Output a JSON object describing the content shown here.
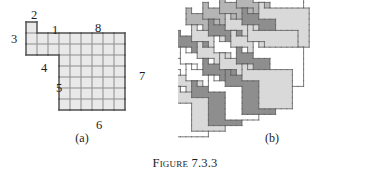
{
  "caption": {
    "label": "Figure",
    "number": "7.3.3"
  },
  "panels": [
    {
      "id": "a",
      "subcaption": "(a)"
    },
    {
      "id": "b",
      "subcaption": "(b)"
    }
  ],
  "figure_a": {
    "description": "Numbered polyomino tile drawn on a square grid",
    "cell_size": 11,
    "origin": {
      "x": 26,
      "y": 22
    },
    "grid_fill": "#e9e9e9",
    "grid_line": "#9a9a9a",
    "outline": "#4a4a4a",
    "cells": [
      [
        0,
        0
      ],
      [
        0,
        1
      ],
      [
        1,
        1
      ],
      [
        2,
        1
      ],
      [
        3,
        1
      ],
      [
        4,
        1
      ],
      [
        5,
        1
      ],
      [
        6,
        1
      ],
      [
        7,
        1
      ],
      [
        8,
        1
      ],
      [
        0,
        2
      ],
      [
        1,
        2
      ],
      [
        2,
        2
      ],
      [
        3,
        2
      ],
      [
        4,
        2
      ],
      [
        5,
        2
      ],
      [
        6,
        2
      ],
      [
        7,
        2
      ],
      [
        8,
        2
      ],
      [
        3,
        3
      ],
      [
        4,
        3
      ],
      [
        5,
        3
      ],
      [
        6,
        3
      ],
      [
        7,
        3
      ],
      [
        8,
        3
      ],
      [
        3,
        4
      ],
      [
        4,
        4
      ],
      [
        5,
        4
      ],
      [
        6,
        4
      ],
      [
        7,
        4
      ],
      [
        8,
        4
      ],
      [
        3,
        5
      ],
      [
        4,
        5
      ],
      [
        5,
        5
      ],
      [
        6,
        5
      ],
      [
        7,
        5
      ],
      [
        8,
        5
      ],
      [
        3,
        6
      ],
      [
        4,
        6
      ],
      [
        5,
        6
      ],
      [
        6,
        6
      ],
      [
        7,
        6
      ],
      [
        8,
        6
      ],
      [
        3,
        7
      ],
      [
        4,
        7
      ],
      [
        5,
        7
      ],
      [
        6,
        7
      ],
      [
        7,
        7
      ],
      [
        8,
        7
      ]
    ],
    "edge_labels": [
      {
        "text": "1",
        "x": 52,
        "y": 24
      },
      {
        "text": "2",
        "x": 31,
        "y": 9
      },
      {
        "text": "3",
        "x": 11,
        "y": 33
      },
      {
        "text": "4",
        "x": 41,
        "y": 62
      },
      {
        "text": "5",
        "x": 56,
        "y": 82
      },
      {
        "text": "6",
        "x": 96,
        "y": 119
      },
      {
        "text": "7",
        "x": 139,
        "y": 70
      },
      {
        "text": "8",
        "x": 95,
        "y": 22
      }
    ]
  },
  "figure_b": {
    "description": "Plane tiling assembled from translated copies of the tile in (a)",
    "cell_size": 5.6,
    "origin": {
      "x": 8,
      "y": 8
    },
    "shades": {
      "white": "#ffffff",
      "light": "#d9d9d9",
      "medium": "#b5b5b5",
      "dark": "#8e8e8e"
    },
    "outline": "#5a5a5a",
    "lattice": {
      "ax": 3,
      "ay": -1,
      "bx": 1,
      "by": 3
    },
    "tiles": [
      {
        "i": 0,
        "j": 0,
        "shade": "medium"
      },
      {
        "i": 1,
        "j": 0,
        "shade": "medium"
      },
      {
        "i": 2,
        "j": 0,
        "shade": "medium"
      },
      {
        "i": 3,
        "j": 0,
        "shade": "medium"
      },
      {
        "i": 4,
        "j": 0,
        "shade": "white"
      },
      {
        "i": -1,
        "j": 1,
        "shade": "dark"
      },
      {
        "i": 0,
        "j": 1,
        "shade": "light"
      },
      {
        "i": 1,
        "j": 1,
        "shade": "dark"
      },
      {
        "i": 2,
        "j": 1,
        "shade": "light"
      },
      {
        "i": 3,
        "j": 1,
        "shade": "dark"
      },
      {
        "i": 4,
        "j": 1,
        "shade": "light"
      },
      {
        "i": -2,
        "j": 2,
        "shade": "white"
      },
      {
        "i": -1,
        "j": 2,
        "shade": "white"
      },
      {
        "i": 0,
        "j": 2,
        "shade": "light"
      },
      {
        "i": 1,
        "j": 2,
        "shade": "white"
      },
      {
        "i": 2,
        "j": 2,
        "shade": "light"
      },
      {
        "i": 3,
        "j": 2,
        "shade": "light"
      },
      {
        "i": -2,
        "j": 3,
        "shade": "light"
      },
      {
        "i": -1,
        "j": 3,
        "shade": "white"
      },
      {
        "i": 0,
        "j": 3,
        "shade": "dark"
      },
      {
        "i": 1,
        "j": 3,
        "shade": "light"
      },
      {
        "i": 2,
        "j": 3,
        "shade": "dark"
      },
      {
        "i": 3,
        "j": 3,
        "shade": "white"
      },
      {
        "i": -3,
        "j": 4,
        "shade": "white"
      },
      {
        "i": -2,
        "j": 4,
        "shade": "light"
      },
      {
        "i": -1,
        "j": 4,
        "shade": "dark"
      },
      {
        "i": 0,
        "j": 4,
        "shade": "white"
      },
      {
        "i": 1,
        "j": 4,
        "shade": "dark"
      },
      {
        "i": 2,
        "j": 4,
        "shade": "light"
      }
    ]
  }
}
